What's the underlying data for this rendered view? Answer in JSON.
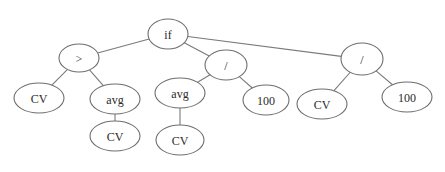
{
  "diagram": {
    "type": "expression-tree",
    "colors": {
      "background": "#ffffff",
      "edge": "#7a7a7a",
      "node_stroke": "#6e6e6e",
      "node_fill": "#ffffff",
      "text": "#2a2a2a"
    },
    "nodes": [
      {
        "id": "n0",
        "label": "if",
        "cx": 168,
        "cy": 34,
        "rx": 20,
        "ry": 15
      },
      {
        "id": "n1",
        "label": ">",
        "cx": 79,
        "cy": 58,
        "rx": 20,
        "ry": 14
      },
      {
        "id": "n2",
        "label": "CV",
        "cx": 39,
        "cy": 98,
        "rx": 25,
        "ry": 15
      },
      {
        "id": "n3",
        "label": "avg",
        "cx": 115,
        "cy": 99,
        "rx": 25,
        "ry": 15
      },
      {
        "id": "n4",
        "label": "CV",
        "cx": 115,
        "cy": 136,
        "rx": 25,
        "ry": 15
      },
      {
        "id": "n5",
        "label": "/",
        "cx": 226,
        "cy": 65,
        "rx": 21,
        "ry": 15
      },
      {
        "id": "n6",
        "label": "avg",
        "cx": 180,
        "cy": 93,
        "rx": 25,
        "ry": 15
      },
      {
        "id": "n7",
        "label": "CV",
        "cx": 180,
        "cy": 140,
        "rx": 24,
        "ry": 15
      },
      {
        "id": "n8",
        "label": "100",
        "cx": 266,
        "cy": 100,
        "rx": 23,
        "ry": 15
      },
      {
        "id": "n9",
        "label": "/",
        "cx": 362,
        "cy": 59,
        "rx": 21,
        "ry": 16
      },
      {
        "id": "n10",
        "label": "CV",
        "cx": 322,
        "cy": 104,
        "rx": 25,
        "ry": 15
      },
      {
        "id": "n11",
        "label": "100",
        "cx": 407,
        "cy": 97,
        "rx": 25,
        "ry": 15
      }
    ],
    "edges": [
      {
        "from": "n0",
        "to": "n1"
      },
      {
        "from": "n0",
        "to": "n5"
      },
      {
        "from": "n0",
        "to": "n9"
      },
      {
        "from": "n1",
        "to": "n2"
      },
      {
        "from": "n1",
        "to": "n3"
      },
      {
        "from": "n3",
        "to": "n4"
      },
      {
        "from": "n5",
        "to": "n6"
      },
      {
        "from": "n5",
        "to": "n8"
      },
      {
        "from": "n6",
        "to": "n7"
      },
      {
        "from": "n9",
        "to": "n10"
      },
      {
        "from": "n9",
        "to": "n11"
      }
    ]
  }
}
